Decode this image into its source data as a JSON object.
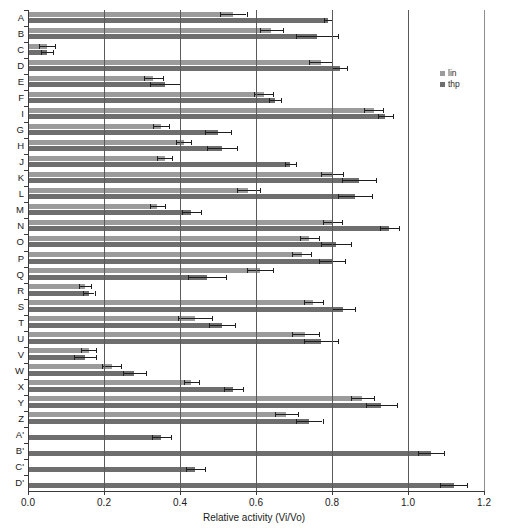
{
  "chart_data": {
    "type": "bar",
    "orientation": "horizontal",
    "title": "",
    "xlabel": "Relative activity (Vi/Vo)",
    "ylabel": "",
    "xlim": [
      0.0,
      1.2
    ],
    "xticks": [
      "0.0",
      "0.2",
      "0.4",
      "0.6",
      "0.8",
      "1.0",
      "1.2"
    ],
    "xtick_values": [
      0.0,
      0.2,
      0.4,
      0.6,
      0.8,
      1.0,
      1.2
    ],
    "grid": "vertical",
    "legend_position": "top-right",
    "legend": [
      "lin",
      "thp"
    ],
    "colors": {
      "lin": "#9b9b9b",
      "thp": "#6e6e6e",
      "error": "#1f1f1f",
      "axis": "#3a3a3a"
    },
    "categories": [
      "A",
      "B",
      "C",
      "D",
      "E",
      "F",
      "I",
      "G",
      "H",
      "J",
      "K",
      "L",
      "M",
      "N",
      "O",
      "P",
      "Q",
      "R",
      "S",
      "T",
      "U",
      "V",
      "W",
      "X",
      "Y",
      "Z",
      "A'",
      "B'",
      "C'",
      "D'"
    ],
    "series": [
      {
        "name": "lin",
        "values": [
          0.54,
          0.64,
          0.05,
          0.77,
          0.33,
          0.62,
          0.91,
          0.35,
          0.41,
          0.36,
          0.8,
          0.58,
          0.34,
          0.8,
          0.74,
          0.72,
          0.61,
          0.15,
          0.75,
          0.44,
          0.73,
          0.16,
          0.22,
          0.43,
          0.88,
          0.68,
          null,
          null,
          null,
          null
        ],
        "errors": [
          0.035,
          0.03,
          0.02,
          0.03,
          0.025,
          0.025,
          0.025,
          0.02,
          0.02,
          0.02,
          0.03,
          0.03,
          0.02,
          0.025,
          0.025,
          0.025,
          0.035,
          0.015,
          0.025,
          0.045,
          0.035,
          0.02,
          0.025,
          0.02,
          0.03,
          0.03,
          null,
          null,
          null,
          null
        ]
      },
      {
        "name": "thp",
        "values": [
          0.79,
          0.76,
          0.05,
          0.82,
          0.36,
          0.65,
          0.94,
          0.5,
          0.51,
          0.69,
          0.87,
          0.86,
          0.43,
          0.95,
          0.81,
          0.8,
          0.47,
          0.16,
          0.83,
          0.51,
          0.77,
          0.15,
          0.28,
          0.54,
          0.93,
          0.74,
          0.35,
          1.06,
          0.44,
          1.12
        ],
        "errors": [
          0.01,
          0.055,
          0.015,
          0.02,
          0.04,
          0.015,
          0.02,
          0.035,
          0.04,
          0.015,
          0.045,
          0.045,
          0.025,
          0.025,
          0.04,
          0.035,
          0.05,
          0.015,
          0.03,
          0.035,
          0.045,
          0.03,
          0.03,
          0.025,
          0.04,
          0.035,
          0.025,
          0.035,
          0.025,
          0.035
        ]
      }
    ]
  }
}
